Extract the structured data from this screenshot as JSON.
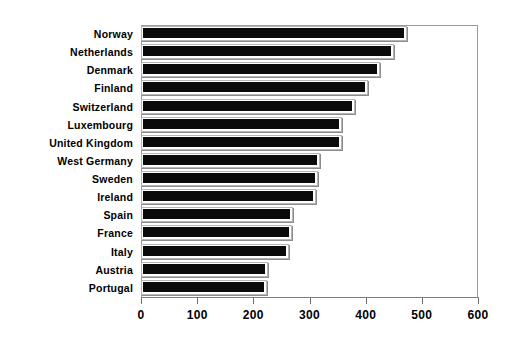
{
  "chart_data": {
    "type": "bar",
    "orientation": "horizontal",
    "title": "",
    "subtitle": "",
    "xlabel": "",
    "ylabel": "",
    "xlim": [
      0,
      600
    ],
    "xticks": [
      0,
      100,
      200,
      300,
      400,
      500,
      600
    ],
    "xtick_labels": [
      "0",
      "100",
      "200",
      "300",
      "400",
      "500",
      "600"
    ],
    "grid": false,
    "legend": null,
    "categories": [
      "Norway",
      "Netherlands",
      "Denmark",
      "Finland",
      "Switzerland",
      "Luxembourg",
      "United Kingdom",
      "West Germany",
      "Sweden",
      "Ireland",
      "Spain",
      "France",
      "Italy",
      "Austria",
      "Portugal"
    ],
    "values": [
      473,
      450,
      425,
      405,
      381,
      358,
      357,
      318,
      316,
      311,
      270,
      269,
      264,
      227,
      224
    ],
    "bar_color": "#0a0a0a",
    "bar_edge_color": "#b5b5b5",
    "background_color": "#ffffff",
    "axis_color": "#9a9a9a"
  }
}
